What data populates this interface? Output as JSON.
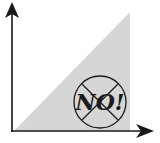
{
  "diagram": {
    "label": "NO!",
    "colors": {
      "fill": "#d6d6d6",
      "axis": "#1a1a1a",
      "background": "#ffffff"
    },
    "icons": [
      "y-axis-arrow",
      "x-axis-arrow",
      "prohibited-circle-icon"
    ]
  }
}
